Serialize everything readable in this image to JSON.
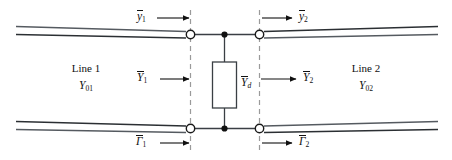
{
  "figure": {
    "background_color": "#ffffff",
    "ink_color": "#111111",
    "dash_color": "#999999",
    "width": 452,
    "height": 160
  },
  "lines": {
    "left": {
      "name": "Line 1",
      "characteristic_symbol": "Y",
      "characteristic_subscript": "01",
      "characteristic_full": "Y01"
    },
    "right": {
      "name": "Line 2",
      "characteristic_symbol": "Y",
      "characteristic_subscript": "02",
      "characteristic_full": "Y02"
    }
  },
  "shunt_element": {
    "symbol": "Y",
    "subscript": "d",
    "full": "Yd",
    "shape": "rectangle"
  },
  "flow_labels": {
    "top_left": {
      "symbol": "y",
      "subscript": "1",
      "overbar": true,
      "arrow_direction": "right",
      "full": "y1"
    },
    "top_right": {
      "symbol": "y",
      "subscript": "2",
      "overbar": true,
      "arrow_direction": "right",
      "full": "y2"
    },
    "mid_left": {
      "symbol": "Y",
      "subscript": "1",
      "overbar": true,
      "arrow_direction": "right",
      "full": "Y1"
    },
    "mid_right": {
      "symbol": "Y",
      "subscript": "2",
      "overbar": true,
      "arrow_direction": "right",
      "full": "Y2"
    },
    "bottom_left": {
      "symbol": "Γ",
      "subscript": "1",
      "overbar": true,
      "arrow_direction": "right",
      "full": "Γ1"
    },
    "bottom_right": {
      "symbol": "Γ",
      "subscript": "2",
      "overbar": true,
      "arrow_direction": "right",
      "full": "Γ2"
    }
  },
  "reference_planes": {
    "left_plane_label": "",
    "right_plane_label": "",
    "style": "dashed"
  },
  "terminals": {
    "count": 4,
    "style": "open-circle"
  },
  "junctions": {
    "count": 2,
    "style": "filled-dot"
  }
}
